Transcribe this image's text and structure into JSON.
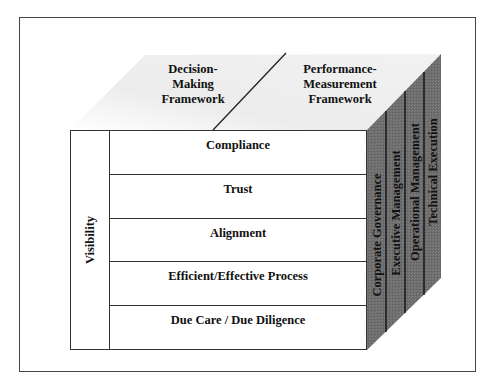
{
  "diagram": {
    "top_face": {
      "left_label": [
        "Decision-",
        "Making",
        "Framework"
      ],
      "right_label": [
        "Performance-",
        "Measurement",
        "Framework"
      ]
    },
    "front_face": {
      "side_column_label": "Visibility",
      "rows": [
        "Compliance",
        "Trust",
        "Alignment",
        "Efficient/Effective Process",
        "Due Care / Due Diligence"
      ]
    },
    "side_face": {
      "columns": [
        "Corporate Governance",
        "Executive Management",
        "Operational Management",
        "Technical Execution"
      ]
    },
    "colors": {
      "side_face_fill": "#6f6f6f",
      "top_face_fill": "#ededed",
      "line": "#333333",
      "frame": "#444444"
    }
  }
}
